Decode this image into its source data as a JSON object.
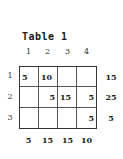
{
  "title": "Table 1",
  "column_headers": [
    "1",
    "2",
    "3",
    "4"
  ],
  "row_headers": [
    "1",
    "2",
    "3"
  ],
  "cells": [
    [
      "5",
      "10",
      "",
      ""
    ],
    [
      "",
      "5",
      "15",
      "5"
    ],
    [
      "",
      "",
      "",
      "5"
    ]
  ],
  "row_totals": [
    "15",
    "25",
    "5"
  ],
  "column_totals": [
    "5",
    "15",
    "15",
    "10"
  ]
}
